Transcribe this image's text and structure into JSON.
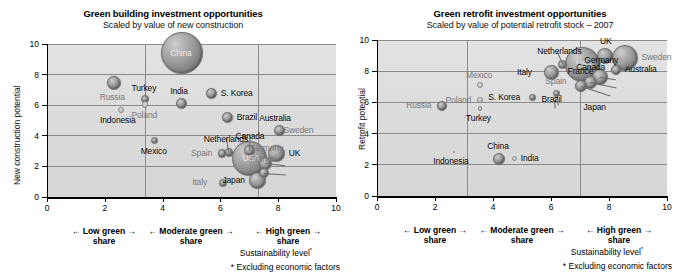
{
  "chart_data": [
    {
      "type": "scatter",
      "id": "green-building",
      "title": "Green building investment opportunities",
      "subtitle": "Scaled by value of new construction",
      "xlabel": "Sustainability level*",
      "ylabel": "New construction potential",
      "xlim": [
        0,
        10
      ],
      "ylim": [
        0,
        10
      ],
      "xticks": [
        0,
        2,
        4,
        6,
        8,
        10
      ],
      "yticks": [
        0,
        2,
        4,
        6,
        8,
        10
      ],
      "grid": true,
      "dividers": [
        3.4,
        7.3
      ],
      "footnote": "* Excluding economic factors",
      "bands": [
        {
          "line1": "← Low green →",
          "line2": "share"
        },
        {
          "line1": "← Moderate green →",
          "line2": "share"
        },
        {
          "line1": "← High green →",
          "line2": "share"
        }
      ],
      "points": [
        {
          "name": "China",
          "x": 4.66,
          "y": 9.4,
          "r": 21.0,
          "label_pos": "inside",
          "label_color": "white"
        },
        {
          "name": "Russia",
          "x": 2.3,
          "y": 7.45,
          "r": 7.0,
          "label_pos": "below",
          "label_color": "grey"
        },
        {
          "name": "Turkey",
          "x": 3.4,
          "y": 6.42,
          "r": 4.0,
          "label_pos": "above",
          "label_color": "dark"
        },
        {
          "name": "India",
          "x": 4.66,
          "y": 6.12,
          "r": 5.5,
          "label_pos": "above",
          "label_color": "dark"
        },
        {
          "name": "S. Korea",
          "x": 5.7,
          "y": 6.75,
          "r": 5.5,
          "label_pos": "right",
          "label_color": "dark"
        },
        {
          "name": "Poland",
          "x": 3.4,
          "y": 6.05,
          "r": 3.2,
          "label_pos": "below",
          "label_color": "grey"
        },
        {
          "name": "Indonesia",
          "x": 2.55,
          "y": 5.68,
          "r": 3.2,
          "label_pos": "below",
          "label_color": "dark"
        },
        {
          "name": "Brazil",
          "x": 6.25,
          "y": 5.18,
          "r": 5.6,
          "label_pos": "right",
          "label_color": "dark"
        },
        {
          "name": "Australia",
          "x": 8.06,
          "y": 4.35,
          "r": 5.6,
          "label_pos": "above",
          "label_color": "dark"
        },
        {
          "name": "Sweden",
          "x": 8.06,
          "y": 4.35,
          "r": 0.0,
          "label_pos": "right",
          "label_color": "grey"
        },
        {
          "name": "Mexico",
          "x": 3.72,
          "y": 3.72,
          "r": 3.6,
          "label_pos": "below",
          "label_color": "dark"
        },
        {
          "name": "Netherlands",
          "x": 6.3,
          "y": 2.9,
          "r": 4.2,
          "label_pos": "leader",
          "label_color": "dark"
        },
        {
          "name": "Canada",
          "x": 7.0,
          "y": 3.05,
          "r": 5.5,
          "label_pos": "leader",
          "label_color": "dark"
        },
        {
          "name": "Spain",
          "x": 6.05,
          "y": 2.85,
          "r": 4.2,
          "label_pos": "left",
          "label_color": "grey"
        },
        {
          "name": "USA",
          "x": 7.0,
          "y": 2.55,
          "r": 17.5,
          "label_pos": "inside",
          "label_color": "white"
        },
        {
          "name": "UK",
          "x": 7.95,
          "y": 2.85,
          "r": 8.5,
          "label_pos": "right",
          "label_color": "dark"
        },
        {
          "name": "Germany",
          "x": 7.55,
          "y": 2.2,
          "r": 6.5,
          "label_pos": "leader",
          "label_color": "grey"
        },
        {
          "name": "France",
          "x": 7.5,
          "y": 1.55,
          "r": 5.0,
          "label_pos": "leader",
          "label_color": "grey"
        },
        {
          "name": "Japan",
          "x": 7.28,
          "y": 1.05,
          "r": 8.5,
          "label_pos": "left",
          "label_color": "dark"
        },
        {
          "name": "Italy",
          "x": 6.08,
          "y": 0.95,
          "r": 4.0,
          "label_pos": "left",
          "label_color": "grey"
        }
      ]
    },
    {
      "type": "scatter",
      "id": "green-retrofit",
      "title": "Green retrofit investment opportunities",
      "subtitle": "Scaled by value of potential retrofit stock – 2007",
      "xlabel": "Sustainability level*",
      "ylabel": "Retrofit potential",
      "xlim": [
        0,
        10
      ],
      "ylim": [
        0,
        10
      ],
      "xticks": [
        0,
        2,
        4,
        6,
        8,
        10
      ],
      "yticks": [
        0,
        2,
        4,
        6,
        8,
        10
      ],
      "grid": true,
      "dividers": [
        3.1,
        7.0
      ],
      "footnote": "* Excluding economic factors",
      "bands": [
        {
          "line1": "← Low green →",
          "line2": "share"
        },
        {
          "line1": "← Moderate green →",
          "line2": "share"
        },
        {
          "line1": "← High green →",
          "line2": "share"
        }
      ],
      "points": [
        {
          "name": "Sweden",
          "x": 8.55,
          "y": 8.85,
          "r": 13.0,
          "label_pos": "right",
          "label_color": "grey"
        },
        {
          "name": "UK",
          "x": 7.85,
          "y": 8.95,
          "r": 8.0,
          "label_pos": "above",
          "label_color": "dark"
        },
        {
          "name": "Netherlands",
          "x": 6.4,
          "y": 8.45,
          "r": 4.5,
          "label_pos": "leader",
          "label_color": "dark"
        },
        {
          "name": "USA",
          "x": 7.1,
          "y": 8.45,
          "r": 17.5,
          "label_pos": "inside",
          "label_color": "white"
        },
        {
          "name": "Italy",
          "x": 6.0,
          "y": 7.95,
          "r": 7.5,
          "label_pos": "left",
          "label_color": "dark"
        },
        {
          "name": "Australia",
          "x": 8.25,
          "y": 8.1,
          "r": 5.0,
          "label_pos": "right",
          "label_color": "dark"
        },
        {
          "name": "Germany",
          "x": 7.7,
          "y": 7.6,
          "r": 8.0,
          "label_pos": "leader",
          "label_color": "dark"
        },
        {
          "name": "Canada",
          "x": 7.35,
          "y": 7.3,
          "r": 6.5,
          "label_pos": "leader",
          "label_color": "dark"
        },
        {
          "name": "France",
          "x": 7.05,
          "y": 7.05,
          "r": 6.0,
          "label_pos": "leader",
          "label_color": "dark"
        },
        {
          "name": "Mexico",
          "x": 3.55,
          "y": 7.1,
          "r": 3.0,
          "label_pos": "above",
          "label_color": "grey"
        },
        {
          "name": "Poland",
          "x": 3.55,
          "y": 6.15,
          "r": 3.2,
          "label_pos": "left",
          "label_color": "grey"
        },
        {
          "name": "S. Korea",
          "x": 5.35,
          "y": 6.3,
          "r": 3.6,
          "label_pos": "left",
          "label_color": "dark"
        },
        {
          "name": "Spain",
          "x": 6.2,
          "y": 6.55,
          "r": 3.6,
          "label_pos": "leader",
          "label_color": "grey"
        },
        {
          "name": "Russia",
          "x": 2.25,
          "y": 5.8,
          "r": 5.0,
          "label_pos": "left",
          "label_color": "grey"
        },
        {
          "name": "Turkey",
          "x": 3.55,
          "y": 5.6,
          "r": 2.4,
          "label_pos": "below",
          "label_color": "dark"
        },
        {
          "name": "Brazil",
          "x": 6.15,
          "y": 5.65,
          "r": 0.0,
          "label_pos": "leader",
          "label_color": "dark"
        },
        {
          "name": "Japan",
          "x": 7.0,
          "y": 5.7,
          "r": 0.0,
          "label_pos": "right",
          "label_color": "dark"
        },
        {
          "name": "China",
          "x": 4.2,
          "y": 2.35,
          "r": 6.0,
          "label_pos": "above",
          "label_color": "dark"
        },
        {
          "name": "India",
          "x": 4.75,
          "y": 2.4,
          "r": 2.6,
          "label_pos": "right",
          "label_color": "dark"
        },
        {
          "name": "Indonesia",
          "x": 2.65,
          "y": 2.8,
          "r": 1.2,
          "label_pos": "below",
          "label_color": "dark"
        }
      ]
    }
  ]
}
